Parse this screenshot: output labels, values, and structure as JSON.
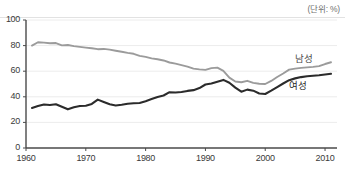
{
  "unit_note": "(단위: %)",
  "chart_data": {
    "type": "line",
    "title": "",
    "xlabel": "",
    "ylabel": "",
    "unit": "%",
    "xlim": [
      1960,
      2012
    ],
    "ylim": [
      0,
      100
    ],
    "grid": true,
    "legend_position": "inline-right",
    "x_ticks": [
      "1960",
      "1970",
      "1980",
      "1990",
      "2000",
      "2010"
    ],
    "x_tick_values": [
      1960,
      1970,
      1980,
      1990,
      2000,
      2010
    ],
    "y_ticks": [
      "0",
      "20",
      "40",
      "60",
      "80",
      "100"
    ],
    "y_tick_values": [
      0,
      20,
      40,
      60,
      80,
      100
    ],
    "x": [
      1961,
      1962,
      1963,
      1964,
      1965,
      1966,
      1967,
      1968,
      1969,
      1970,
      1971,
      1972,
      1973,
      1974,
      1975,
      1976,
      1977,
      1978,
      1979,
      1980,
      1981,
      1982,
      1983,
      1984,
      1985,
      1986,
      1987,
      1988,
      1989,
      1990,
      1991,
      1992,
      1993,
      1994,
      1995,
      1996,
      1997,
      1998,
      1999,
      2000,
      2001,
      2002,
      2003,
      2004,
      2005,
      2006,
      2007,
      2008,
      2009,
      2010,
      2011
    ],
    "series": [
      {
        "name": "남성",
        "color": "#9b9b9b",
        "values": [
          80.0,
          82.6,
          82.3,
          81.8,
          82.0,
          80.2,
          80.5,
          79.6,
          79.0,
          78.4,
          77.9,
          77.2,
          77.4,
          76.9,
          76.0,
          75.2,
          74.3,
          73.6,
          72.0,
          71.2,
          70.0,
          69.3,
          68.4,
          66.8,
          65.9,
          64.8,
          63.6,
          62.0,
          61.4,
          61.0,
          62.4,
          62.8,
          60.2,
          55.0,
          52.0,
          51.4,
          52.5,
          50.9,
          50.2,
          50.0,
          52.4,
          55.5,
          58.2,
          61.2,
          62.0,
          62.6,
          63.0,
          63.4,
          64.0,
          65.6,
          67.0
        ]
      },
      {
        "name": "여성",
        "color": "#2b2b2b",
        "values": [
          31.3,
          32.8,
          34.0,
          33.6,
          34.2,
          32.2,
          30.2,
          31.8,
          32.8,
          33.0,
          34.4,
          37.8,
          36.0,
          34.2,
          33.2,
          33.8,
          34.6,
          35.0,
          35.2,
          36.6,
          38.2,
          39.8,
          41.0,
          43.6,
          43.4,
          43.8,
          44.6,
          45.2,
          46.8,
          49.6,
          50.4,
          51.8,
          53.2,
          51.0,
          47.2,
          44.0,
          45.6,
          44.8,
          42.6,
          42.2,
          44.8,
          47.6,
          50.4,
          53.0,
          54.4,
          55.4,
          56.0,
          56.4,
          56.8,
          57.4,
          58.0
        ]
      }
    ],
    "annotations": [
      {
        "text": "남성",
        "near_x": 2007,
        "near_y": 71
      },
      {
        "text": "여성",
        "near_x": 2006,
        "near_y": 50
      }
    ]
  },
  "footnote": ""
}
